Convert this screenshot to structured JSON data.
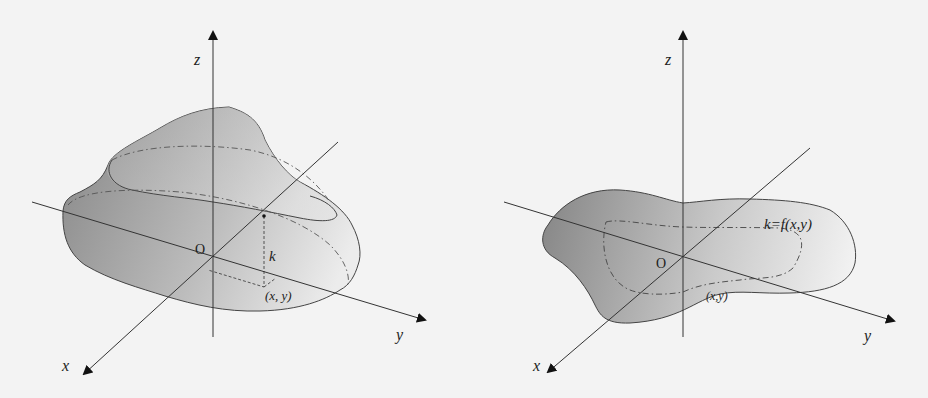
{
  "figures": [
    {
      "id": "left",
      "description": "3D solid surface over a region with level curves and a point (x,y) at height k",
      "axes": {
        "x_label": "x",
        "y_label": "y",
        "z_label": "z",
        "origin_label": "O"
      },
      "annotations": {
        "height_label": "k",
        "point_label": "(x, y)"
      }
    },
    {
      "id": "right",
      "description": "Flat region in the xy-plane with a dash-dot contour and function label",
      "axes": {
        "x_label": "x",
        "y_label": "y",
        "z_label": "z",
        "origin_label": "O"
      },
      "annotations": {
        "function_label": "k=f(x,y)",
        "point_label": "(x,y)"
      }
    }
  ],
  "colors": {
    "background": "#f3f3f3",
    "surface_dark": "#8a8a8a",
    "surface_light": "#f0f0f0",
    "line": "#333333"
  }
}
